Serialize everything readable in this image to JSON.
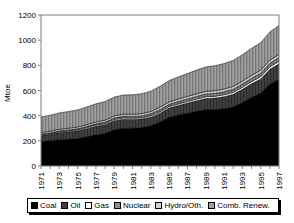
{
  "chart_data": {
    "type": "area",
    "stacked": true,
    "title": "",
    "xlabel": "",
    "ylabel": "Mtoe",
    "ylim": [
      0,
      1200
    ],
    "yticks": [
      0,
      200,
      400,
      600,
      800,
      1000,
      1200
    ],
    "ytick_labels": [
      "0",
      "200",
      "400",
      "600",
      "800",
      "1000",
      "1200"
    ],
    "grid": false,
    "legend_position": "bottom",
    "x": [
      1971,
      1972,
      1973,
      1974,
      1975,
      1976,
      1977,
      1978,
      1979,
      1980,
      1981,
      1982,
      1983,
      1984,
      1985,
      1986,
      1987,
      1988,
      1989,
      1990,
      1991,
      1992,
      1993,
      1994,
      1995,
      1996,
      1997
    ],
    "xtick_labels": [
      "1971",
      "1973",
      "1975",
      "1977",
      "1979",
      "1981",
      "1983",
      "1985",
      "1987",
      "1989",
      "1991",
      "1993",
      "1995",
      "1997"
    ],
    "xtick_values": [
      1971,
      1973,
      1975,
      1977,
      1979,
      1981,
      1983,
      1985,
      1987,
      1989,
      1991,
      1993,
      1995,
      1997
    ],
    "series": [
      {
        "name": "Coal",
        "color": "#000000",
        "pattern": "solid",
        "values": [
          195,
          200,
          208,
          212,
          218,
          232,
          248,
          258,
          288,
          300,
          300,
          305,
          320,
          350,
          388,
          405,
          420,
          435,
          448,
          448,
          455,
          470,
          505,
          545,
          580,
          650,
          690
        ]
      },
      {
        "name": "Oil",
        "color": "#3a3a3a",
        "pattern": "solid-dark",
        "values": [
          48,
          52,
          58,
          60,
          62,
          65,
          68,
          70,
          72,
          72,
          70,
          68,
          68,
          70,
          72,
          76,
          80,
          84,
          88,
          92,
          96,
          100,
          104,
          108,
          112,
          118,
          122
        ]
      },
      {
        "name": "Gas",
        "color": "#ffffff",
        "pattern": "empty",
        "values": [
          6,
          6,
          7,
          7,
          8,
          8,
          9,
          9,
          10,
          10,
          10,
          10,
          11,
          11,
          12,
          12,
          13,
          13,
          14,
          14,
          15,
          15,
          16,
          17,
          18,
          19,
          20
        ]
      },
      {
        "name": "Nuclear",
        "color": "#9a9a9a",
        "pattern": "hatch-dense",
        "values": [
          4,
          5,
          6,
          7,
          8,
          9,
          10,
          11,
          12,
          13,
          14,
          15,
          16,
          17,
          18,
          19,
          20,
          21,
          22,
          23,
          24,
          25,
          26,
          27,
          28,
          29,
          30
        ]
      },
      {
        "name": "Hydro/Oth.",
        "color": "#bdbdbd",
        "pattern": "hatch-light",
        "values": [
          12,
          13,
          13,
          14,
          14,
          15,
          15,
          16,
          16,
          17,
          17,
          18,
          18,
          19,
          19,
          20,
          20,
          21,
          21,
          22,
          22,
          23,
          23,
          24,
          24,
          25,
          25
        ]
      },
      {
        "name": "Comb. Renew.",
        "color": "#8c8c8c",
        "pattern": "hatch-vertical",
        "values": [
          125,
          128,
          130,
          133,
          136,
          140,
          144,
          148,
          150,
          152,
          155,
          158,
          162,
          166,
          170,
          176,
          182,
          188,
          194,
          198,
          202,
          206,
          210,
          214,
          218,
          224,
          230
        ]
      }
    ],
    "totals": [
      390,
      404,
      422,
      433,
      446,
      469,
      494,
      512,
      548,
      564,
      566,
      574,
      595,
      633,
      679,
      708,
      735,
      762,
      787,
      797,
      814,
      839,
      884,
      935,
      980,
      1065,
      1117
    ]
  },
  "legend": {
    "items": [
      {
        "label": "Coal"
      },
      {
        "label": "Oil"
      },
      {
        "label": "Gas"
      },
      {
        "label": "Nuclear"
      },
      {
        "label": "Hydro/Oth."
      },
      {
        "label": "Comb. Renew."
      }
    ]
  }
}
